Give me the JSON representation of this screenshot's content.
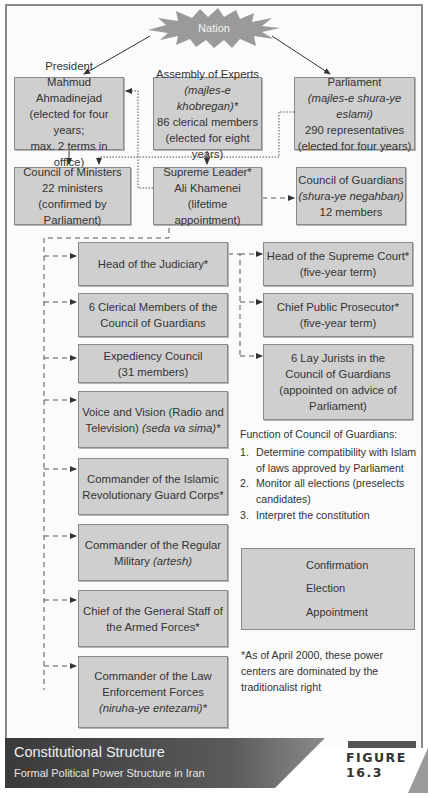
{
  "nation": {
    "label": "Nation"
  },
  "boxes": {
    "president": {
      "l1": "President",
      "l2": "Mahmud Ahmadinejad",
      "l3": "(elected for four years;",
      "l4": "max. 2 terms in office)"
    },
    "assembly": {
      "l1": "Assembly of Experts",
      "l2": "(majles-e khobregan)*",
      "l3": "86 clerical members",
      "l4": "(elected for eight years)"
    },
    "parliament": {
      "l1": "Parliament",
      "l2": "(majles-e shura-ye eslami)",
      "l3": "290 representatives",
      "l4": "(elected for four years)"
    },
    "ministers": {
      "l1": "Council of Ministers",
      "l2": "22 ministers",
      "l3": "(confirmed by Parliament)"
    },
    "leader": {
      "l1": "Supreme Leader*",
      "l2": "Ali Khamenei",
      "l3": "(lifetime appointment)"
    },
    "guardians": {
      "l1": "Council of Guardians",
      "l2": "(shura-ye negahban)",
      "l3": "12 members"
    },
    "judiciary": {
      "l1": "Head of the Judiciary*"
    },
    "clerical": {
      "l1": "6 Clerical Members of the",
      "l2": "Council of Guardians"
    },
    "expediency": {
      "l1": "Expediency Council",
      "l2": "(31 members)"
    },
    "voice": {
      "l1": "Voice and Vision (Radio and",
      "l2a": "Television) ",
      "l2b": "(seda va sima)*"
    },
    "irgc": {
      "l1": "Commander of the Islamic",
      "l2": "Revolutionary Guard Corps*"
    },
    "military": {
      "l1": "Commander of the Regular",
      "l2a": "Military ",
      "l2b": "(artesh)"
    },
    "staff": {
      "l1": "Chief of the General Staff of",
      "l2": "the Armed Forces*"
    },
    "law": {
      "l1": "Commander of the Law",
      "l2": "Enforcement Forces",
      "l3": "(niruha-ye entezami)*"
    },
    "supreme_court": {
      "l1": "Head of the Supreme Court*",
      "l2": "(five-year term)"
    },
    "prosecutor": {
      "l1": "Chief Public Prosecutor*",
      "l2": "(five-year term)"
    },
    "lay_jurists": {
      "l1": "6 Lay Jurists in the",
      "l2": "Council of Guardians",
      "l3": "(appointed on advice of",
      "l4": "Parliament)"
    }
  },
  "functions": {
    "title": "Function of Council of Guardians:",
    "items": [
      {
        "n": "1.",
        "text": "Determine compatibility with Islam of laws approved by Parliament"
      },
      {
        "n": "2.",
        "text": "Monitor all elections (preselects candidates)"
      },
      {
        "n": "3.",
        "text": "Interpret the constitution"
      }
    ]
  },
  "legend": {
    "confirmation": "Confirmation",
    "election": "Election",
    "appointment": "Appointment"
  },
  "note": "*As of April 2000, these power centers are dominated by the traditionalist right",
  "footer": {
    "title": "Constitutional Structure",
    "subtitle": "Formal Political Power Structure in Iran",
    "figure": "FIGURE 16.3"
  },
  "colors": {
    "box_fill": "#cfcfcf",
    "box_border": "#8a8a8a",
    "footer_dark": "#3a3a3a",
    "starburst": "#9a9a9a"
  }
}
